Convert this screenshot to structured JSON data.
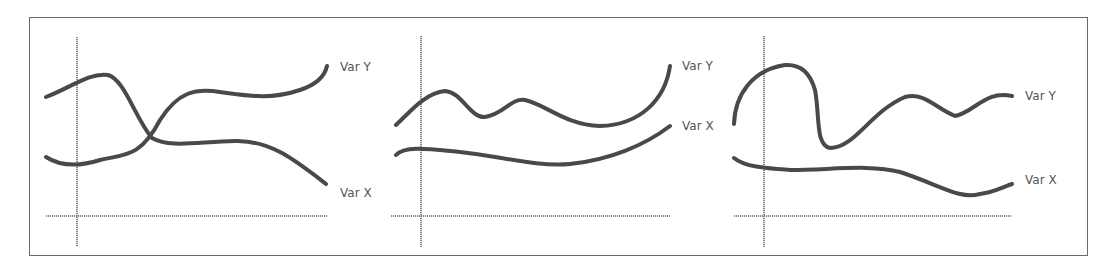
{
  "figure": {
    "panels": [
      {
        "id": "panel-1",
        "relationship": "lines cross",
        "labels": {
          "var_y": "Var Y",
          "var_x": "Var X"
        }
      },
      {
        "id": "panel-2",
        "relationship": "lines roughly parallel, both rising at right",
        "labels": {
          "var_y": "Var Y",
          "var_x": "Var X"
        }
      },
      {
        "id": "panel-3",
        "relationship": "lines independent",
        "labels": {
          "var_y": "Var Y",
          "var_x": "Var X"
        }
      }
    ]
  },
  "colors": {
    "curve": "#4a4a4a",
    "axis": "#8a8a8a",
    "frame": "#6a6a6a",
    "label": "#555555"
  }
}
